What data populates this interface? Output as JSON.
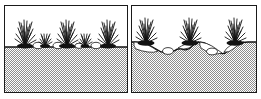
{
  "figure": {
    "kind": "two-panel-comparison-illustration",
    "style": "black-and-white line drawing with dithered gray stipple fill",
    "panel_count": 2,
    "colors": {
      "frame": "#1a1a1a",
      "ink": "#111111",
      "soil_gray": "#9a9a9a",
      "soil_dither_light": "#ffffff",
      "sky_background": "#ffffff",
      "stone_fill": "#ffffff"
    }
  },
  "panels": [
    {
      "id": "left",
      "name": "uneroded-soil-panel",
      "caption": "",
      "surface": "flat level soil line",
      "ground_line_y": 40,
      "soil_fill": "dithered gray",
      "grass_clumps": [
        {
          "x": 20,
          "height": 26,
          "blades": 17,
          "size": "large"
        },
        {
          "x": 40,
          "height": 13,
          "blades": 11,
          "size": "small"
        },
        {
          "x": 62,
          "height": 28,
          "blades": 18,
          "size": "large"
        },
        {
          "x": 80,
          "height": 11,
          "blades": 9,
          "size": "small"
        },
        {
          "x": 103,
          "height": 27,
          "blades": 18,
          "size": "large"
        }
      ],
      "stones": [
        {
          "x": 33,
          "rx": 5,
          "ry": 3
        },
        {
          "x": 53,
          "rx": 5,
          "ry": 3
        },
        {
          "x": 74,
          "rx": 4,
          "ry": 2
        },
        {
          "x": 91,
          "rx": 5,
          "ry": 3
        }
      ]
    },
    {
      "id": "right",
      "name": "eroded-soil-panel",
      "caption": "",
      "surface": "eroded surface with soil pedestals beneath grass clumps",
      "ground_line_y": 46,
      "soil_fill": "dithered gray",
      "pedestals": [
        {
          "center_x": 20,
          "top_y": 36,
          "half_width": 19
        },
        {
          "center_x": 64,
          "top_y": 36,
          "half_width": 20
        },
        {
          "center_x": 108,
          "top_y": 36,
          "half_width": 20
        }
      ],
      "grass_clumps": [
        {
          "x": 20,
          "height": 25,
          "blades": 17,
          "size": "large"
        },
        {
          "x": 64,
          "height": 27,
          "blades": 18,
          "size": "large"
        },
        {
          "x": 108,
          "height": 26,
          "blades": 17,
          "size": "large"
        }
      ],
      "stones": [
        {
          "x": 44,
          "rx": 5,
          "ry": 3
        },
        {
          "x": 86,
          "rx": 5,
          "ry": 3
        }
      ]
    }
  ],
  "icon_names": {
    "grass": "grass-clump-icon",
    "stone": "stone-icon",
    "soil": "soil-mass-icon",
    "pedestal": "soil-pedestal-icon"
  }
}
